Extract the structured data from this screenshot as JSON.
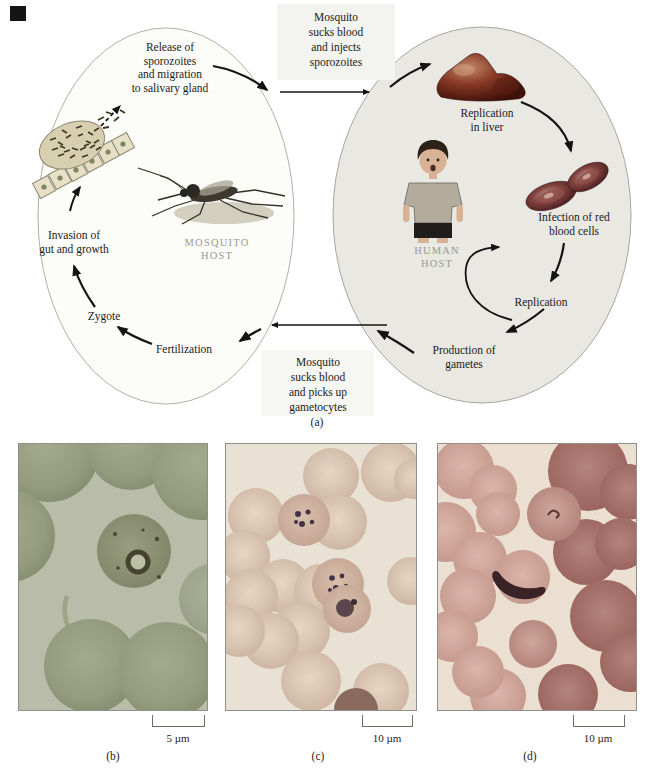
{
  "colors": {
    "mosquito_oval_fill": "#fcfcf8",
    "human_oval_fill": "#e9e8e2",
    "oval_stroke": "#aeaba0",
    "host_label_gray": "#9a9a90",
    "liver_red": "#7e3322",
    "rbc_maroon": "#4c2125",
    "arrow_black": "#141414",
    "micrograph_b_bg": "#b8bca8",
    "micrograph_c_bg": "#e9e2d4",
    "micrograph_d_bg": "#eadfd1"
  },
  "panel_a": {
    "caption": "(a)",
    "transfer_top": [
      "Mosquito",
      "sucks blood",
      "and injects",
      "sporozoites"
    ],
    "transfer_bottom": [
      "Mosquito",
      "sucks blood",
      "and picks up",
      "gametocytes"
    ],
    "mosquito_host": {
      "host_label": [
        "MOSQUITO",
        "HOST"
      ],
      "release": [
        "Release of",
        "sporozoites",
        "and migration",
        "to salivary gland"
      ],
      "invasion": [
        "Invasion of",
        "gut and growth"
      ],
      "zygote": "Zygote",
      "fertilization": "Fertilization"
    },
    "human_host": {
      "host_label": [
        "HUMAN",
        "HOST"
      ],
      "replication_liver": [
        "Replication",
        "in liver"
      ],
      "infection_rbc": [
        "Infection of red",
        "blood cells"
      ],
      "replication": "Replication",
      "production": [
        "Production of",
        "gametes"
      ]
    }
  },
  "panel_b": {
    "caption": "(b)",
    "scale_label": "5 µm"
  },
  "panel_c": {
    "caption": "(c)",
    "scale_label": "10 µm"
  },
  "panel_d": {
    "caption": "(d)",
    "scale_label": "10 µm"
  }
}
